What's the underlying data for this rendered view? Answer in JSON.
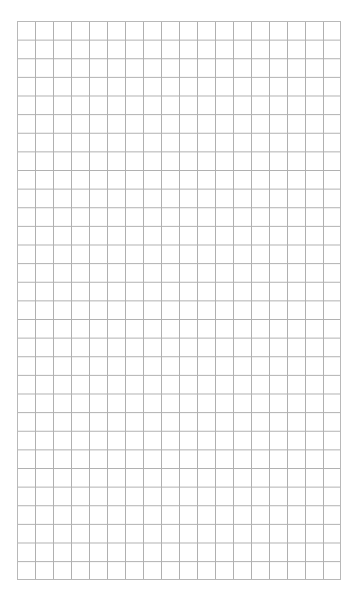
{
  "page": {
    "type": "blank graph paper",
    "grid": {
      "columns": 18,
      "rows": 30,
      "line_color": "#b0b0b0",
      "background": "#ffffff"
    }
  }
}
